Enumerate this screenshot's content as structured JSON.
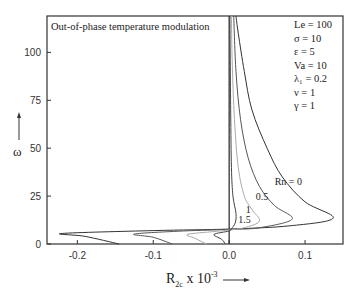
{
  "chart_data": {
    "type": "line",
    "title": "Out-of-phase temperature modulation",
    "xlabel": "R_2c x 10^-3",
    "xlabel_parts": {
      "base": "R",
      "sub": "2c",
      "mid": " x 10",
      "sup": "-3"
    },
    "ylabel": "ω",
    "xlim": [
      -0.24,
      0.15
    ],
    "ylim": [
      0,
      119
    ],
    "xticks": [
      -0.2,
      -0.1,
      0.0,
      0.1
    ],
    "xtick_labels": [
      "-0.2",
      "-0.1",
      "0.0",
      "0.1"
    ],
    "yticks": [
      0,
      25,
      50,
      75,
      100
    ],
    "ytick_labels": [
      "0",
      "25",
      "50",
      "75",
      "100"
    ],
    "grid": false,
    "parameters": [
      {
        "label": "Le = 100"
      },
      {
        "label": "σ = 10"
      },
      {
        "label": "ε = 5"
      },
      {
        "label": "Va = 10"
      },
      {
        "label": "λ₁ = 0.2"
      },
      {
        "label": "ν = 1"
      },
      {
        "label": "γ = 1"
      }
    ],
    "series": [
      {
        "name": "Rn = 0",
        "label": "Rn = 0",
        "color": "#333333",
        "points": [
          [
            -0.145,
            0
          ],
          [
            -0.19,
            4
          ],
          [
            -0.22,
            5.5
          ],
          [
            -0.1,
            7.0
          ],
          [
            0.0,
            7.8
          ],
          [
            0.08,
            9.5
          ],
          [
            0.137,
            13.5
          ],
          [
            0.1,
            22
          ],
          [
            0.07,
            35
          ],
          [
            0.05,
            50
          ],
          [
            0.03,
            70
          ],
          [
            0.02,
            90
          ],
          [
            0.012,
            110
          ],
          [
            0.009,
            119
          ]
        ]
      },
      {
        "name": "Rn = 0.5",
        "label": "0.5",
        "color": "#555555",
        "points": [
          [
            -0.075,
            0
          ],
          [
            -0.1,
            3.5
          ],
          [
            -0.125,
            5.2
          ],
          [
            -0.06,
            6.8
          ],
          [
            0.0,
            7.6
          ],
          [
            0.04,
            8.5
          ],
          [
            0.083,
            13
          ],
          [
            0.06,
            20
          ],
          [
            0.04,
            30
          ],
          [
            0.025,
            45
          ],
          [
            0.015,
            65
          ],
          [
            0.009,
            90
          ],
          [
            0.006,
            119
          ]
        ]
      },
      {
        "name": "Rn = 1",
        "label": "1",
        "color": "#aaaaaa",
        "points": [
          [
            -0.03,
            0
          ],
          [
            -0.045,
            3
          ],
          [
            -0.055,
            5
          ],
          [
            -0.02,
            6.5
          ],
          [
            0.0,
            7.3
          ],
          [
            0.02,
            8.5
          ],
          [
            0.04,
            12
          ],
          [
            0.03,
            18
          ],
          [
            0.02,
            25
          ],
          [
            0.012,
            40
          ],
          [
            0.007,
            65
          ],
          [
            0.004,
            95
          ],
          [
            0.003,
            119
          ]
        ]
      },
      {
        "name": "Rn = 1.5",
        "label": "1.5",
        "color": "#444444",
        "points": [
          [
            -0.005,
            0
          ],
          [
            -0.01,
            2.5
          ],
          [
            -0.02,
            5
          ],
          [
            0.0,
            6.8
          ],
          [
            0.003,
            8
          ],
          [
            0.008,
            11
          ],
          [
            0.009,
            16
          ],
          [
            0.005,
            25
          ],
          [
            0.003,
            40
          ],
          [
            0.002,
            70
          ],
          [
            0.001,
            119
          ]
        ]
      }
    ],
    "series_label_positions": [
      {
        "label": "Rn = 0",
        "x": 0.06,
        "y": 31
      },
      {
        "label": "0.5",
        "x": 0.035,
        "y": 23
      },
      {
        "label": "1",
        "x": 0.022,
        "y": 16
      },
      {
        "label": "1.5",
        "x": 0.012,
        "y": 11
      }
    ]
  }
}
